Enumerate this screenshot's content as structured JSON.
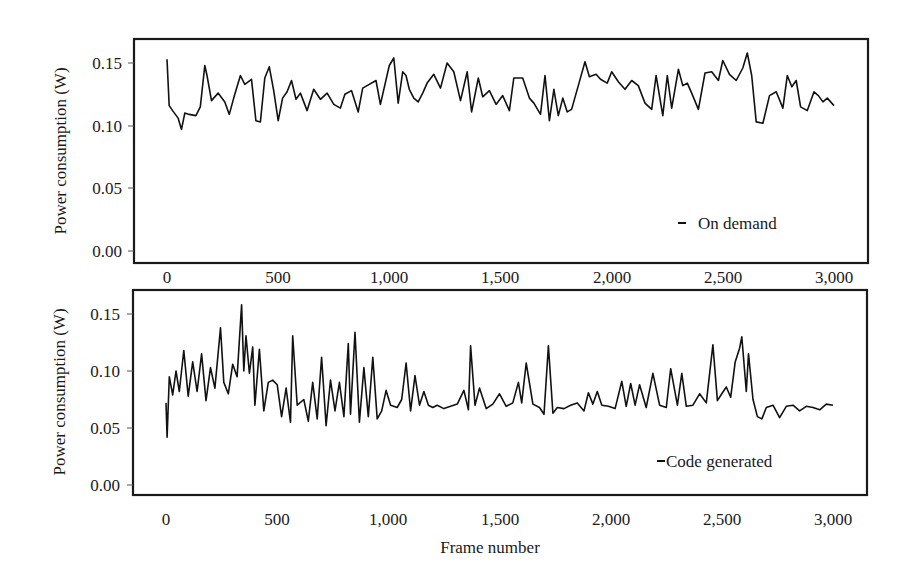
{
  "figure": {
    "xlabel": "Frame number",
    "ylabel": "Power consumption (W)"
  },
  "chart_data": [
    {
      "type": "line",
      "title": "",
      "xlabel": "",
      "ylabel": "Power consumption (W)",
      "xlim": [
        0,
        3000
      ],
      "ylim": [
        0.0,
        0.16
      ],
      "xticks": [
        0,
        500,
        1000,
        1500,
        2000,
        2500,
        3000
      ],
      "xtick_labels": [
        "0",
        "500",
        "1,000",
        "1,500",
        "2,000",
        "2,500",
        "3,000"
      ],
      "yticks": [
        0.0,
        0.05,
        0.1,
        0.15
      ],
      "ytick_labels": [
        "0.00",
        "0.05",
        "0.10",
        "0.15"
      ],
      "grid": false,
      "legend_position": "lower right",
      "series": [
        {
          "name": "On demand",
          "color": "#111111",
          "x": [
            0,
            10,
            25,
            50,
            65,
            80,
            100,
            130,
            150,
            170,
            180,
            200,
            230,
            260,
            280,
            300,
            330,
            350,
            380,
            400,
            420,
            440,
            460,
            480,
            500,
            520,
            540,
            560,
            580,
            600,
            630,
            660,
            690,
            720,
            750,
            780,
            800,
            830,
            860,
            880,
            900,
            940,
            960,
            1000,
            1020,
            1040,
            1060,
            1075,
            1090,
            1110,
            1130,
            1150,
            1170,
            1200,
            1230,
            1260,
            1290,
            1320,
            1350,
            1370,
            1400,
            1420,
            1450,
            1480,
            1510,
            1540,
            1560,
            1600,
            1630,
            1650,
            1680,
            1700,
            1720,
            1740,
            1760,
            1780,
            1800,
            1820,
            1850,
            1880,
            1900,
            1930,
            1950,
            1980,
            2000,
            2030,
            2060,
            2090,
            2120,
            2150,
            2180,
            2200,
            2230,
            2250,
            2270,
            2300,
            2320,
            2340,
            2360,
            2390,
            2420,
            2450,
            2480,
            2500,
            2530,
            2560,
            2590,
            2610,
            2630,
            2650,
            2680,
            2710,
            2740,
            2770,
            2790,
            2810,
            2830,
            2850,
            2880,
            2910,
            2930,
            2950,
            2970,
            3000
          ],
          "y": [
            0.153,
            0.116,
            0.112,
            0.106,
            0.097,
            0.11,
            0.109,
            0.108,
            0.115,
            0.148,
            0.14,
            0.12,
            0.126,
            0.119,
            0.109,
            0.122,
            0.14,
            0.133,
            0.137,
            0.104,
            0.103,
            0.138,
            0.147,
            0.128,
            0.104,
            0.122,
            0.127,
            0.136,
            0.121,
            0.126,
            0.112,
            0.129,
            0.121,
            0.126,
            0.117,
            0.114,
            0.125,
            0.128,
            0.111,
            0.13,
            0.132,
            0.136,
            0.117,
            0.148,
            0.154,
            0.118,
            0.143,
            0.14,
            0.129,
            0.122,
            0.119,
            0.126,
            0.134,
            0.141,
            0.13,
            0.15,
            0.143,
            0.12,
            0.143,
            0.111,
            0.138,
            0.123,
            0.128,
            0.117,
            0.124,
            0.112,
            0.138,
            0.138,
            0.122,
            0.118,
            0.109,
            0.14,
            0.104,
            0.129,
            0.108,
            0.122,
            0.111,
            0.113,
            0.132,
            0.151,
            0.139,
            0.141,
            0.137,
            0.134,
            0.143,
            0.135,
            0.129,
            0.136,
            0.132,
            0.118,
            0.113,
            0.14,
            0.108,
            0.14,
            0.114,
            0.145,
            0.132,
            0.134,
            0.126,
            0.113,
            0.142,
            0.143,
            0.136,
            0.152,
            0.141,
            0.136,
            0.146,
            0.158,
            0.14,
            0.103,
            0.102,
            0.124,
            0.127,
            0.114,
            0.14,
            0.131,
            0.136,
            0.115,
            0.112,
            0.127,
            0.124,
            0.119,
            0.122,
            0.116,
            0.105
          ]
        }
      ]
    },
    {
      "type": "line",
      "title": "",
      "xlabel": "Frame number",
      "ylabel": "Power consumption (W)",
      "xlim": [
        0,
        3000
      ],
      "ylim": [
        0.0,
        0.16
      ],
      "xticks": [
        0,
        500,
        1000,
        1500,
        2000,
        2500,
        3000
      ],
      "xtick_labels": [
        "0",
        "500",
        "1,000",
        "1,500",
        "2,000",
        "2,500",
        "3,000"
      ],
      "yticks": [
        0.0,
        0.05,
        0.1,
        0.15
      ],
      "ytick_labels": [
        "0.00",
        "0.05",
        "0.10",
        "0.15"
      ],
      "grid": false,
      "legend_position": "lower right",
      "series": [
        {
          "name": "Code generated",
          "color": "#111111",
          "x": [
            0,
            5,
            15,
            30,
            45,
            60,
            80,
            100,
            120,
            140,
            160,
            180,
            200,
            220,
            245,
            260,
            280,
            300,
            320,
            340,
            350,
            360,
            375,
            390,
            400,
            420,
            440,
            460,
            480,
            500,
            520,
            540,
            560,
            570,
            590,
            620,
            640,
            660,
            680,
            700,
            720,
            740,
            760,
            780,
            800,
            820,
            830,
            850,
            870,
            890,
            910,
            930,
            950,
            970,
            990,
            1010,
            1040,
            1060,
            1080,
            1100,
            1120,
            1140,
            1160,
            1180,
            1200,
            1220,
            1250,
            1280,
            1310,
            1340,
            1360,
            1370,
            1390,
            1410,
            1440,
            1470,
            1500,
            1530,
            1560,
            1585,
            1600,
            1620,
            1650,
            1680,
            1700,
            1720,
            1740,
            1760,
            1790,
            1820,
            1850,
            1880,
            1900,
            1920,
            1940,
            1960,
            1990,
            2020,
            2050,
            2070,
            2090,
            2110,
            2130,
            2160,
            2190,
            2220,
            2250,
            2270,
            2300,
            2320,
            2340,
            2370,
            2400,
            2430,
            2460,
            2480,
            2500,
            2520,
            2540,
            2560,
            2580,
            2590,
            2610,
            2620,
            2640,
            2660,
            2680,
            2700,
            2730,
            2760,
            2790,
            2820,
            2850,
            2880,
            2910,
            2940,
            2970,
            3000
          ],
          "y": [
            0.072,
            0.042,
            0.095,
            0.079,
            0.1,
            0.082,
            0.118,
            0.078,
            0.108,
            0.082,
            0.115,
            0.074,
            0.103,
            0.085,
            0.138,
            0.09,
            0.08,
            0.106,
            0.095,
            0.158,
            0.1,
            0.131,
            0.098,
            0.121,
            0.07,
            0.119,
            0.065,
            0.09,
            0.092,
            0.088,
            0.06,
            0.085,
            0.055,
            0.131,
            0.07,
            0.075,
            0.056,
            0.09,
            0.058,
            0.112,
            0.052,
            0.092,
            0.065,
            0.09,
            0.06,
            0.124,
            0.062,
            0.134,
            0.055,
            0.103,
            0.06,
            0.112,
            0.058,
            0.065,
            0.083,
            0.07,
            0.068,
            0.075,
            0.107,
            0.065,
            0.096,
            0.07,
            0.082,
            0.07,
            0.068,
            0.07,
            0.067,
            0.069,
            0.071,
            0.083,
            0.066,
            0.122,
            0.07,
            0.085,
            0.067,
            0.071,
            0.08,
            0.069,
            0.072,
            0.09,
            0.072,
            0.107,
            0.071,
            0.068,
            0.062,
            0.122,
            0.063,
            0.068,
            0.067,
            0.07,
            0.072,
            0.065,
            0.081,
            0.071,
            0.082,
            0.07,
            0.069,
            0.067,
            0.091,
            0.069,
            0.089,
            0.07,
            0.088,
            0.068,
            0.098,
            0.07,
            0.068,
            0.102,
            0.07,
            0.098,
            0.069,
            0.07,
            0.08,
            0.072,
            0.123,
            0.074,
            0.08,
            0.086,
            0.077,
            0.108,
            0.12,
            0.13,
            0.082,
            0.115,
            0.075,
            0.06,
            0.058,
            0.068,
            0.07,
            0.059,
            0.069,
            0.07,
            0.065,
            0.069,
            0.068,
            0.066,
            0.071,
            0.07,
            0.063
          ]
        }
      ]
    }
  ],
  "panels": [
    {
      "legend": "On demand",
      "ytick_labels": [
        "0.15",
        "0.10",
        "0.05",
        "0.00"
      ],
      "xtick_labels": [
        "0",
        "500",
        "1,000",
        "1,500",
        "2,000",
        "2,500",
        "3,000"
      ],
      "ylabel": "Power consumption (W)"
    },
    {
      "legend": "Code generated",
      "ytick_labels": [
        "0.15",
        "0.10",
        "0.05",
        "0.00"
      ],
      "xtick_labels": [
        "0",
        "500",
        "1,000",
        "1,500",
        "2,000",
        "2,500",
        "3,000"
      ],
      "ylabel": "Power consumption (W)"
    }
  ]
}
